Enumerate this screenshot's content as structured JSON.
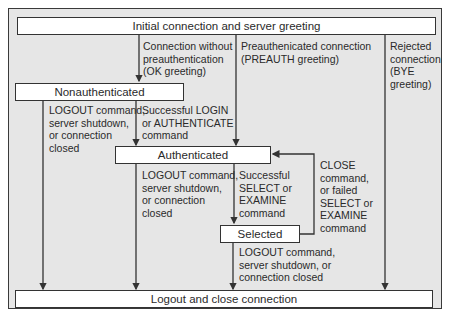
{
  "diagram": {
    "states": {
      "initial": "Initial connection and server greeting",
      "nonauthenticated": "Nonauthenticated",
      "authenticated": "Authenticated",
      "selected": "Selected",
      "logout": "Logout and close connection"
    },
    "transitions": {
      "no_preauth": "Connection without\npreauthentication\n(OK greeting)",
      "preauth": "Preauthenicated connection\n(PREAUTH greeting)",
      "rejected": "Rejected\nconnection\n(BYE\ngreeting)",
      "nonauth_logout": "LOGOUT command,\nserver shutdown,\nor connection\nclosed",
      "login": "Successful LOGIN\nor AUTHENTICATE\ncommand",
      "auth_logout": "LOGOUT command,\nserver shutdown,\nor connection\nclosed",
      "select": "Successful\nSELECT or\nEXAMINE\ncommand",
      "close": "CLOSE\ncommand,\nor failed\nSELECT or\nEXAMINE\ncommand",
      "selected_logout": "LOGOUT command,\nserver shutdown, or\nconnection closed"
    },
    "colors": {
      "background": "#e6e6e6",
      "box": "#ffffff",
      "line": "#333333"
    }
  }
}
